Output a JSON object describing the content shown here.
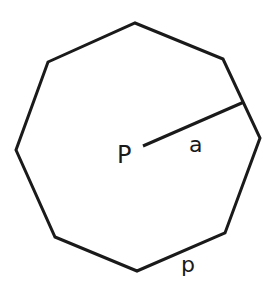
{
  "diagram": {
    "shape": "regular octagon",
    "stroke_color": "#1a1a1a",
    "background": "#ffffff",
    "labels": {
      "center": "P",
      "apothem": "a",
      "perimeter": "p"
    }
  }
}
